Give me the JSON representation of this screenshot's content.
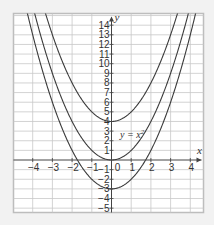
{
  "chart_data": {
    "type": "line",
    "title": "",
    "xlabel": "x",
    "ylabel": "y",
    "xlim": [
      -4.9,
      4.7
    ],
    "ylim": [
      -5.5,
      15.3
    ],
    "grid": true,
    "legend": "none",
    "x_ticks": [
      -4,
      -3,
      -2,
      -1,
      0,
      1,
      2,
      3,
      4
    ],
    "x_tick_labels": [
      "−4",
      "−3",
      "−2",
      "−1",
      "0",
      "1",
      "2",
      "3",
      "4"
    ],
    "y_ticks": [
      -5,
      -4,
      -3,
      -2,
      -1,
      1,
      2,
      3,
      4,
      5,
      6,
      7,
      8,
      9,
      10,
      11,
      12,
      13,
      14
    ],
    "y_tick_labels": [
      "−5",
      "−4",
      "−3",
      "−2",
      "−1",
      "1",
      "2",
      "3",
      "4",
      "5",
      "6",
      "7",
      "8",
      "9",
      "10",
      "11",
      "12",
      "13",
      "14"
    ],
    "series": [
      {
        "name": "y = x² + 4",
        "function": "x^2 + 4",
        "vertex": [
          0,
          4
        ],
        "coefficient": 1,
        "shift": 4
      },
      {
        "name": "y = x²",
        "function": "x^2",
        "vertex": [
          0,
          0
        ],
        "coefficient": 1,
        "shift": 0
      },
      {
        "name": "y = x² − 3",
        "function": "x^2 - 3",
        "vertex": [
          0,
          -3
        ],
        "coefficient": 1,
        "shift": -3
      }
    ],
    "annotations": [
      {
        "text": "y = x²",
        "x": 0.45,
        "y": 2.6,
        "labels_series": "y = x²"
      }
    ]
  },
  "labels": {
    "x_axis": "x",
    "y_axis": "y",
    "curve_annotation_prefix": "y = x",
    "curve_annotation_sup": "2"
  },
  "colors": {
    "background": "#f2f2f2",
    "plot_background": "#ffffff",
    "frame": "#bdbdbd",
    "grid": "#c8c8c8",
    "axis": "#444444",
    "curve": "#3a3a3a"
  }
}
